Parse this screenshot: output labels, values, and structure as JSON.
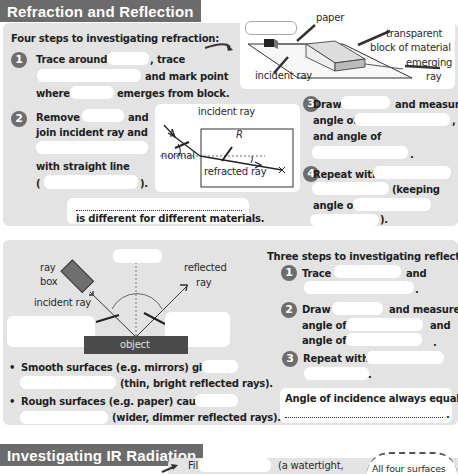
{
  "sections": {
    "refraction": {
      "title": "Refraction and Reflection",
      "intro": "Four steps to investigating refraction:",
      "steps": [
        {
          "number": "1",
          "lines": [
            "Trace around",
            ", trace",
            "and mark point",
            "where",
            "emerges from block."
          ]
        },
        {
          "number": "2",
          "lines": [
            "Remove",
            "and",
            "join incident ray and",
            "with straight line",
            "(",
            ")."
          ]
        },
        {
          "number": "3",
          "lines": [
            "Draw",
            "and measure",
            "angle of",
            ",",
            "and angle of",
            "."
          ]
        },
        {
          "number": "4",
          "lines": [
            "Repeat with",
            "(keeping",
            "angle of",
            ")."
          ]
        }
      ],
      "note": "is different for different materials.",
      "diagram_top_labels": {
        "paper": "paper",
        "block": "transparent block of material",
        "block_line1": "transparent",
        "block_line2": "block of material",
        "emerging_line1": "emerging",
        "emerging_line2": "ray",
        "incident": "incident ray"
      },
      "diagram_angles": {
        "incident": "incident ray",
        "i": "I",
        "r": "R",
        "normal": "normal",
        "refracted": "refracted ray"
      }
    },
    "reflection": {
      "intro": "Three steps to investigating reflection:",
      "diagram_labels": {
        "ray_box_1": "ray",
        "ray_box_2": "box",
        "incident": "incident ray",
        "reflected_1": "reflected",
        "reflected_2": "ray",
        "object": "object"
      },
      "bullets": [
        {
          "a": "Smooth surfaces (e.g. mirrors) give",
          "b": "(thin, bright reflected rays)."
        },
        {
          "a": "Rough surfaces (e.g. paper) cause",
          "b": "(wider, dimmer reflected rays)."
        }
      ],
      "steps": [
        {
          "number": "1",
          "lines": [
            "Trace",
            "and",
            "."
          ]
        },
        {
          "number": "2",
          "lines": [
            "Draw",
            "and measure",
            "angle of",
            "and",
            "angle of",
            "."
          ]
        },
        {
          "number": "3",
          "lines": [
            "Repeat with",
            "."
          ]
        }
      ],
      "rule": "Angle of incidence always equals",
      "rule_end": "."
    },
    "ir": {
      "title": "Investigating IR Radiation",
      "fill": "Fill",
      "paren": "(a watertight,",
      "callout": "All four surfaces"
    }
  },
  "colors": {
    "header_bg": "#6b6b6b",
    "panel_bg": "#e3e3e3",
    "number_bg": "#6d6d6d",
    "object_bg": "#4a4a4a"
  }
}
